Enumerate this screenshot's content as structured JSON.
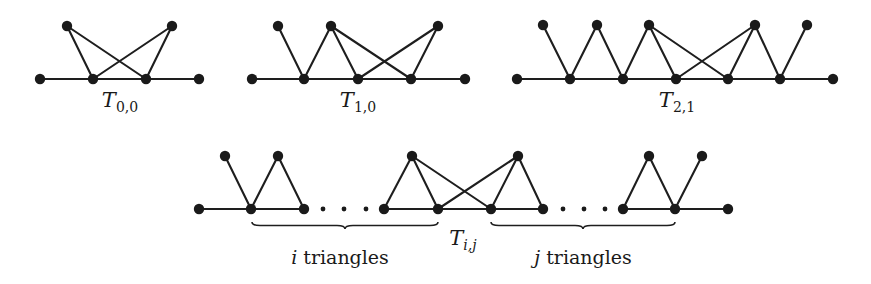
{
  "figure": {
    "graphs": [
      {
        "id": "T00",
        "label": {
          "main": "T",
          "sub": "0,0",
          "x": 120,
          "y": 107
        },
        "nodes": [
          {
            "x": 40,
            "y": 79
          },
          {
            "x": 93,
            "y": 79
          },
          {
            "x": 146,
            "y": 79
          },
          {
            "x": 199,
            "y": 79
          },
          {
            "x": 67,
            "y": 26
          },
          {
            "x": 172,
            "y": 26
          }
        ],
        "path": [
          [
            40,
            79
          ],
          [
            199,
            79
          ]
        ],
        "edges": [
          [
            4,
            1
          ],
          [
            4,
            2
          ],
          [
            5,
            1
          ],
          [
            5,
            2
          ]
        ]
      },
      {
        "id": "T10",
        "label": {
          "main": "T",
          "sub": "1,0",
          "x": 358,
          "y": 107
        },
        "nodes": [
          {
            "x": 252,
            "y": 79
          },
          {
            "x": 304,
            "y": 79
          },
          {
            "x": 358,
            "y": 79
          },
          {
            "x": 411,
            "y": 79
          },
          {
            "x": 465,
            "y": 79
          },
          {
            "x": 278,
            "y": 26
          },
          {
            "x": 331,
            "y": 26
          },
          {
            "x": 438,
            "y": 26
          }
        ],
        "path": [
          [
            252,
            79
          ],
          [
            465,
            79
          ]
        ],
        "edges": [
          [
            5,
            1
          ],
          [
            6,
            1
          ],
          [
            6,
            2
          ],
          [
            6,
            3
          ],
          [
            7,
            2
          ],
          [
            7,
            3
          ]
        ]
      },
      {
        "id": "T21",
        "label": {
          "main": "T",
          "sub": "2,1",
          "x": 677,
          "y": 107
        },
        "nodes": [
          {
            "x": 517,
            "y": 79
          },
          {
            "x": 570,
            "y": 79
          },
          {
            "x": 623,
            "y": 79
          },
          {
            "x": 676,
            "y": 79
          },
          {
            "x": 728,
            "y": 79
          },
          {
            "x": 780,
            "y": 79
          },
          {
            "x": 833,
            "y": 79
          },
          {
            "x": 543,
            "y": 25
          },
          {
            "x": 597,
            "y": 25
          },
          {
            "x": 649,
            "y": 25
          },
          {
            "x": 755,
            "y": 25
          },
          {
            "x": 807,
            "y": 25
          }
        ],
        "path": [
          [
            517,
            79
          ],
          [
            833,
            79
          ]
        ],
        "edges": [
          [
            7,
            1
          ],
          [
            8,
            1
          ],
          [
            8,
            2
          ],
          [
            9,
            2
          ],
          [
            9,
            3
          ],
          [
            9,
            4
          ],
          [
            10,
            3
          ],
          [
            10,
            4
          ],
          [
            10,
            5
          ],
          [
            11,
            5
          ]
        ]
      },
      {
        "id": "Tij",
        "label": {
          "main": "T",
          "sub": "i,j",
          "x": 463,
          "y": 245
        },
        "nodes": [
          {
            "x": 199,
            "y": 209
          },
          {
            "x": 251,
            "y": 209
          },
          {
            "x": 304,
            "y": 209
          },
          {
            "x": 384,
            "y": 209
          },
          {
            "x": 438,
            "y": 209
          },
          {
            "x": 491,
            "y": 209
          },
          {
            "x": 543,
            "y": 209
          },
          {
            "x": 623,
            "y": 209
          },
          {
            "x": 675,
            "y": 209
          },
          {
            "x": 728,
            "y": 209
          },
          {
            "x": 225,
            "y": 156
          },
          {
            "x": 278,
            "y": 156
          },
          {
            "x": 412,
            "y": 156
          },
          {
            "x": 518,
            "y": 156
          },
          {
            "x": 649,
            "y": 156
          },
          {
            "x": 702,
            "y": 156
          }
        ],
        "path": [
          [
            199,
            209
          ],
          [
            304,
            209
          ]
        ],
        "path2": [
          [
            384,
            209
          ],
          [
            543,
            209
          ]
        ],
        "path3": [
          [
            623,
            209
          ],
          [
            728,
            209
          ]
        ],
        "edges": [
          [
            10,
            1
          ],
          [
            11,
            1
          ],
          [
            11,
            2
          ],
          [
            12,
            3
          ],
          [
            12,
            4
          ],
          [
            12,
            5
          ],
          [
            13,
            4
          ],
          [
            13,
            5
          ],
          [
            13,
            6
          ],
          [
            14,
            7
          ],
          [
            14,
            8
          ],
          [
            15,
            8
          ]
        ],
        "ellipsis": [
          {
            "x": 323,
            "y": 209
          },
          {
            "x": 344,
            "y": 209
          },
          {
            "x": 366,
            "y": 209
          },
          {
            "x": 563,
            "y": 209
          },
          {
            "x": 584,
            "y": 209
          },
          {
            "x": 605,
            "y": 209
          }
        ],
        "braces": [
          {
            "x1": 252,
            "x2": 438,
            "y": 222,
            "caption_var": "i",
            "caption_text": " triangles",
            "cx": 340,
            "cy": 264
          },
          {
            "x1": 491,
            "x2": 675,
            "y": 222,
            "caption_var": "j",
            "caption_text": " triangles",
            "cx": 583,
            "cy": 264
          }
        ]
      }
    ]
  }
}
